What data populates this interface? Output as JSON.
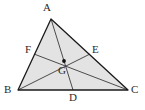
{
  "figure": {
    "name": "triangle-centroid-medians",
    "canvas": {
      "width": 145,
      "height": 110
    },
    "background_color": "#ffffff",
    "fill_color": "#e3e3e3",
    "stroke_color": "#3a3a3a",
    "outline_color": "#1a1a1a",
    "label_color": "#2b2b2b",
    "point_color": "#111111"
  },
  "points": {
    "A": {
      "label": "A",
      "x": 51,
      "y": 19,
      "label_x": 43,
      "label_y": 2,
      "kind": "vertex"
    },
    "B": {
      "label": "B",
      "x": 18,
      "y": 90,
      "label_x": 4,
      "label_y": 84,
      "kind": "vertex"
    },
    "C": {
      "label": "C",
      "x": 128,
      "y": 90,
      "label_x": 131,
      "label_y": 84,
      "kind": "vertex"
    },
    "D": {
      "label": "D",
      "x": 73,
      "y": 90,
      "label_x": 69,
      "label_y": 92,
      "kind": "midpoint"
    },
    "E": {
      "label": "E",
      "x": 90,
      "y": 54,
      "label_x": 92,
      "label_y": 44,
      "kind": "midpoint"
    },
    "F": {
      "label": "F",
      "x": 34,
      "y": 54,
      "label_x": 25,
      "label_y": 44,
      "kind": "midpoint"
    },
    "G": {
      "label": "G",
      "x": 64,
      "y": 61,
      "label_x": 58,
      "label_y": 65,
      "kind": "centroid"
    }
  },
  "segments": [
    {
      "name": "side-AB",
      "from": "A",
      "to": "B",
      "role": "triangle-side"
    },
    {
      "name": "side-BC",
      "from": "B",
      "to": "C",
      "role": "triangle-side"
    },
    {
      "name": "side-CA",
      "from": "C",
      "to": "A",
      "role": "triangle-side"
    },
    {
      "name": "median-AD",
      "from": "A",
      "to": "D",
      "role": "median"
    },
    {
      "name": "median-BE",
      "from": "B",
      "to": "E",
      "role": "median"
    },
    {
      "name": "median-CF",
      "from": "C",
      "to": "F",
      "role": "median"
    }
  ]
}
